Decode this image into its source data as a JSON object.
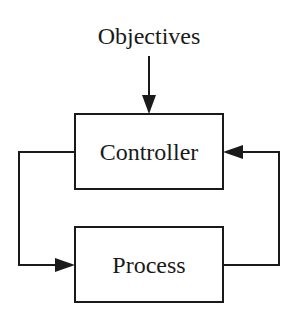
{
  "diagram": {
    "input_label": "Objectives",
    "blocks": [
      {
        "id": "controller",
        "label": "Controller"
      },
      {
        "id": "process",
        "label": "Process"
      }
    ],
    "edges": [
      {
        "from": "objectives",
        "to": "controller"
      },
      {
        "from": "controller",
        "to": "process"
      },
      {
        "from": "process",
        "to": "controller"
      }
    ],
    "line_color": "#1a1a1a"
  }
}
